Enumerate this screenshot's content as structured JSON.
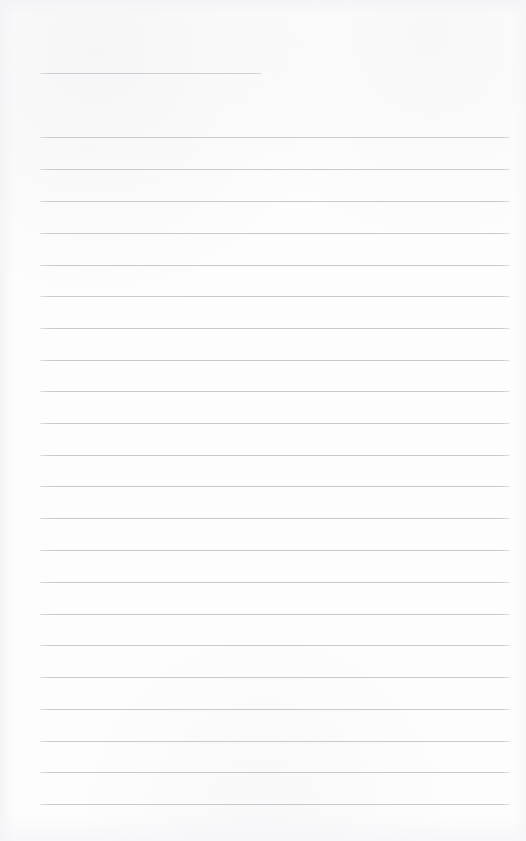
{
  "document": {
    "kind": "ruled-paper",
    "title": "Blank Ruled Notepaper",
    "description": "A blank lined writing sheet with no handwritten or printed content",
    "page_width": 526,
    "page_height": 841,
    "background_color": "#fdfdfd",
    "rule_color": "#c9c9cf",
    "rule_thickness": 1,
    "rule_spacing": 31.8,
    "text_content": "",
    "margin_left": 40,
    "margin_right": 510
  },
  "rules": {
    "header_rule": {
      "label": "header-short-rule",
      "y": 73,
      "x_start": 40,
      "x_end": 262,
      "width": 222
    },
    "body_x_start": 40,
    "body_x_end": 510,
    "body_width": 470,
    "body_count": 22,
    "body_lines": [
      {
        "index": 1,
        "y": 137
      },
      {
        "index": 2,
        "y": 169
      },
      {
        "index": 3,
        "y": 201
      },
      {
        "index": 4,
        "y": 233
      },
      {
        "index": 5,
        "y": 265
      },
      {
        "index": 6,
        "y": 296
      },
      {
        "index": 7,
        "y": 328
      },
      {
        "index": 8,
        "y": 360
      },
      {
        "index": 9,
        "y": 391
      },
      {
        "index": 10,
        "y": 423
      },
      {
        "index": 11,
        "y": 455
      },
      {
        "index": 12,
        "y": 486
      },
      {
        "index": 13,
        "y": 518
      },
      {
        "index": 14,
        "y": 550
      },
      {
        "index": 15,
        "y": 582
      },
      {
        "index": 16,
        "y": 614
      },
      {
        "index": 17,
        "y": 645
      },
      {
        "index": 18,
        "y": 677
      },
      {
        "index": 19,
        "y": 709
      },
      {
        "index": 20,
        "y": 741
      },
      {
        "index": 21,
        "y": 772
      },
      {
        "index": 22,
        "y": 804
      }
    ]
  }
}
